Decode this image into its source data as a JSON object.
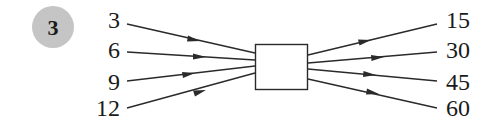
{
  "problem": {
    "number": "3",
    "badge_color": "#c8c8c8"
  },
  "function_machine": {
    "inputs": [
      "3",
      "6",
      "9",
      "12"
    ],
    "outputs": [
      "15",
      "30",
      "45",
      "60"
    ],
    "box_label": ""
  }
}
